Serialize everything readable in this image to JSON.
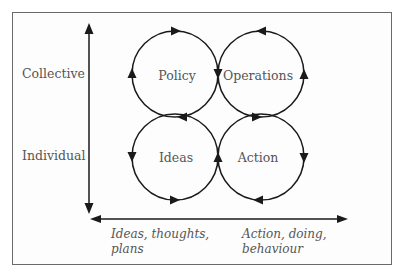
{
  "diagram": {
    "type": "four-cycle quadrant diagram",
    "y_axis": {
      "top_label": "Collective",
      "bottom_label": "Individual"
    },
    "x_axis": {
      "left_label_line1": "Ideas, thoughts,",
      "left_label_line2": "plans",
      "right_label_line1": "Action, doing,",
      "right_label_line2": "behaviour"
    },
    "cycles": [
      {
        "name": "Policy",
        "position": "top-left",
        "direction": "clockwise"
      },
      {
        "name": "Operations",
        "position": "top-right",
        "direction": "counterclockwise"
      },
      {
        "name": "Ideas",
        "position": "bottom-left",
        "direction": "counterclockwise"
      },
      {
        "name": "Action",
        "position": "bottom-right",
        "direction": "clockwise"
      }
    ],
    "colors": {
      "line": "#1a1a1a",
      "text": "#555555",
      "frame": "#6a6a6a",
      "background": "#ffffff"
    }
  }
}
